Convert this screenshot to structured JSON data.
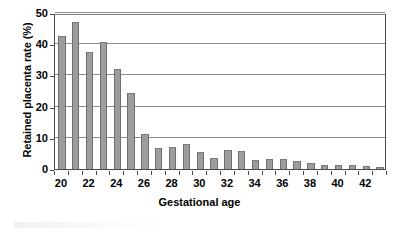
{
  "chart_data": {
    "type": "bar",
    "title": "",
    "xlabel": "Gestational age",
    "ylabel": "Retained placenta rate (%)",
    "ylim": [
      0,
      50
    ],
    "ytick_values": [
      0,
      10,
      20,
      30,
      40,
      50
    ],
    "ytick_labels": [
      "0",
      "10",
      "20",
      "30",
      "40",
      "50"
    ],
    "grid": "horizontal",
    "legend": "none",
    "bar_color": "#9d9d9d",
    "bar_edge_color": "#6e6e6e",
    "axis_color": "#4a4a4a",
    "gridline_color": "#8c8c8c",
    "categories": [
      20,
      21,
      22,
      23,
      24,
      25,
      26,
      27,
      28,
      29,
      30,
      31,
      32,
      33,
      34,
      35,
      36,
      37,
      38,
      39,
      40,
      41,
      42,
      43
    ],
    "xtick_labels_shown": [
      "20",
      "22",
      "24",
      "26",
      "28",
      "30",
      "32",
      "34",
      "36",
      "38",
      "40",
      "42"
    ],
    "values": [
      42.5,
      47.0,
      37.6,
      40.6,
      32.0,
      24.3,
      11.3,
      6.6,
      7.2,
      8.0,
      5.6,
      3.5,
      6.0,
      5.8,
      3.0,
      3.1,
      3.3,
      2.6,
      1.8,
      1.4,
      1.4,
      1.4,
      1.0,
      0.8
    ]
  }
}
